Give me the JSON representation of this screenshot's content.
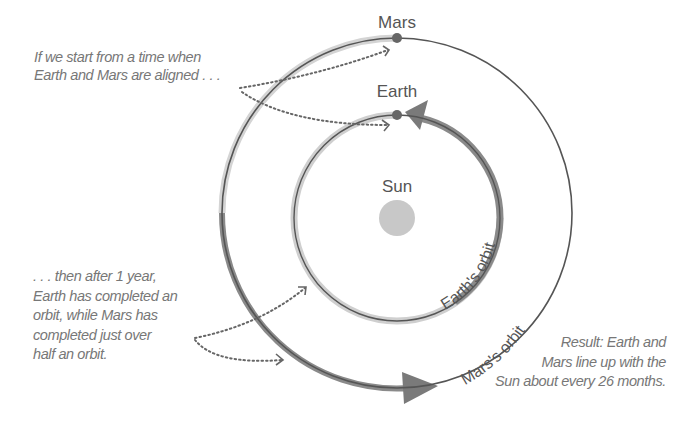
{
  "labels": {
    "mars": "Mars",
    "earth": "Earth",
    "sun": "Sun",
    "earth_orbit": "Earth's orbit",
    "mars_orbit": "Mars's orbit"
  },
  "captions": {
    "start": [
      "If we start from a time when",
      "Earth and Mars are aligned . . ."
    ],
    "after_year": [
      ". . . then after 1 year,",
      "Earth has completed an",
      "orbit, while Mars has",
      "completed just over",
      "half an orbit."
    ],
    "result": [
      "Result: Earth and",
      "Mars line up with the",
      "Sun about every 26 months."
    ]
  },
  "colors": {
    "orbit_line": "#555555",
    "earth_arc": "#8a8a8a",
    "light_ring": "#cfcfcf",
    "sun": "#c8c8c8",
    "planet": "#666666",
    "text": "#777777"
  }
}
